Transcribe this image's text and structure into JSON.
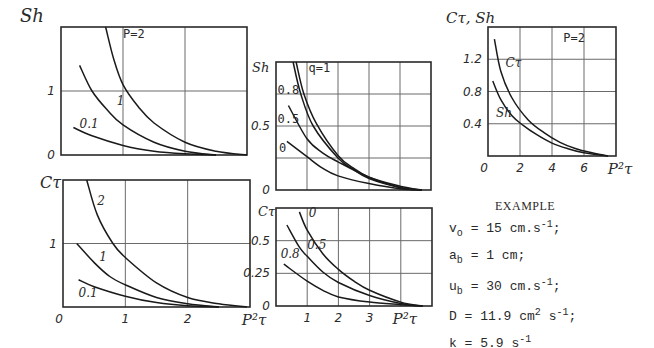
{
  "chart_data": [
    {
      "id": "top-left",
      "type": "line",
      "ylabel": "Sh",
      "xlabel": "P²τ",
      "xlim": [
        0,
        3
      ],
      "ylim": [
        0,
        2
      ],
      "xgrid": [
        1,
        2
      ],
      "ygrid": [
        1
      ],
      "yticks": [
        {
          "v": 0,
          "label": "0"
        },
        {
          "v": 1,
          "label": "1"
        }
      ],
      "xticks": [],
      "annotation": "P=2",
      "series": [
        {
          "name": "2",
          "label": "P=2",
          "x": [
            0.72,
            0.85,
            1.0,
            1.25,
            1.5,
            2.0,
            2.5,
            3.0
          ],
          "y": [
            2.0,
            1.5,
            1.1,
            0.75,
            0.5,
            0.2,
            0.06,
            0.0
          ]
        },
        {
          "name": "1",
          "label": "1",
          "x": [
            0.3,
            0.5,
            0.75,
            1.0,
            1.5,
            2.0,
            2.5
          ],
          "y": [
            1.4,
            1.0,
            0.7,
            0.47,
            0.2,
            0.06,
            0.0
          ]
        },
        {
          "name": "0.1",
          "label": "0.1",
          "x": [
            0.2,
            0.5,
            1.0,
            1.5,
            2.0,
            2.5
          ],
          "y": [
            0.43,
            0.3,
            0.15,
            0.06,
            0.02,
            0.0
          ]
        }
      ]
    },
    {
      "id": "bottom-left",
      "type": "line",
      "ylabel": "Cτ",
      "xlabel": "P²τ",
      "xlim": [
        0,
        3
      ],
      "ylim": [
        0,
        2
      ],
      "xgrid": [
        1,
        2
      ],
      "ygrid": [
        1
      ],
      "yticks": [
        {
          "v": 1,
          "label": "1"
        }
      ],
      "xticks": [
        {
          "v": 0,
          "label": "0"
        },
        {
          "v": 1,
          "label": "1"
        },
        {
          "v": 2,
          "label": "2"
        },
        {
          "v": 3,
          "label": "P²τ"
        }
      ],
      "series": [
        {
          "name": "2",
          "label": "2",
          "x": [
            0.38,
            0.55,
            0.8,
            1.0,
            1.5,
            2.0,
            2.5,
            2.95
          ],
          "y": [
            2.0,
            1.45,
            1.0,
            0.78,
            0.38,
            0.15,
            0.05,
            0.0
          ]
        },
        {
          "name": "1",
          "label": "1",
          "x": [
            0.22,
            0.5,
            0.75,
            1.0,
            1.5,
            2.0,
            2.5
          ],
          "y": [
            1.0,
            0.7,
            0.48,
            0.35,
            0.15,
            0.05,
            0.0
          ]
        },
        {
          "name": "0.1",
          "label": "0.1",
          "x": [
            0.25,
            0.5,
            1.0,
            1.5,
            2.0,
            2.5
          ],
          "y": [
            0.43,
            0.32,
            0.17,
            0.07,
            0.02,
            0.0
          ]
        }
      ]
    },
    {
      "id": "middle-top",
      "type": "line",
      "ylabel": "Sh",
      "xlabel": "",
      "xlim": [
        0,
        5
      ],
      "ylim": [
        0,
        1
      ],
      "xgrid": [
        1,
        2,
        3,
        4
      ],
      "ygrid": [
        0.25,
        0.5,
        0.75
      ],
      "yticks": [
        {
          "v": 0,
          "label": "0"
        },
        {
          "v": 0.5,
          "label": "0.5"
        }
      ],
      "xticks": [],
      "annotation": "q=1",
      "series": [
        {
          "name": "1",
          "label": "q=1",
          "x": [
            0.65,
            0.9,
            1.3,
            2.0,
            2.5,
            3.0,
            4.0,
            4.7
          ],
          "y": [
            1.0,
            0.75,
            0.52,
            0.27,
            0.17,
            0.1,
            0.02,
            0.0
          ]
        },
        {
          "name": "0.8",
          "label": "0.8",
          "x": [
            0.55,
            0.8,
            1.2,
            2.0,
            2.5,
            3.0,
            4.0,
            4.7
          ],
          "y": [
            1.0,
            0.75,
            0.5,
            0.25,
            0.16,
            0.09,
            0.02,
            0.0
          ]
        },
        {
          "name": "0.5",
          "label": "0.5",
          "x": [
            0.4,
            1.0,
            1.5,
            2.0,
            3.0,
            4.0,
            4.7
          ],
          "y": [
            0.66,
            0.4,
            0.29,
            0.22,
            0.1,
            0.03,
            0.0
          ]
        },
        {
          "name": "0",
          "label": "0",
          "x": [
            0.35,
            1.0,
            1.5,
            2.0,
            3.0,
            4.0,
            4.7
          ],
          "y": [
            0.38,
            0.26,
            0.17,
            0.11,
            0.05,
            0.01,
            0.0
          ]
        }
      ]
    },
    {
      "id": "middle-bottom",
      "type": "line",
      "ylabel": "Cτ",
      "xlabel": "P²τ",
      "xlim": [
        0,
        5
      ],
      "ylim": [
        0,
        0.75
      ],
      "xgrid": [
        1,
        2,
        3,
        4
      ],
      "ygrid": [
        0.25,
        0.5
      ],
      "yticks": [
        {
          "v": 0,
          "label": "0"
        },
        {
          "v": 0.25,
          "label": "0.25"
        },
        {
          "v": 0.5,
          "label": "0.5"
        }
      ],
      "xticks": [
        {
          "v": 1,
          "label": "1"
        },
        {
          "v": 2,
          "label": "2"
        },
        {
          "v": 3,
          "label": "3"
        },
        {
          "v": 4,
          "label": "P²τ"
        }
      ],
      "series": [
        {
          "name": "0",
          "label": "0",
          "x": [
            0.75,
            1.0,
            1.5,
            2.0,
            2.5,
            3.0,
            4.0,
            4.7
          ],
          "y": [
            0.72,
            0.58,
            0.4,
            0.28,
            0.19,
            0.12,
            0.03,
            0.0
          ]
        },
        {
          "name": "0.5",
          "label": "0.5",
          "x": [
            0.35,
            0.75,
            1.0,
            1.5,
            2.0,
            3.0,
            4.0,
            4.7
          ],
          "y": [
            0.62,
            0.45,
            0.38,
            0.26,
            0.18,
            0.08,
            0.02,
            0.0
          ]
        },
        {
          "name": "0.8",
          "label": "0.8",
          "x": [
            0.25,
            1.0,
            1.5,
            2.0,
            3.0,
            4.0,
            4.7
          ],
          "y": [
            0.32,
            0.19,
            0.12,
            0.07,
            0.03,
            0.01,
            0.0
          ]
        }
      ]
    },
    {
      "id": "right",
      "type": "line",
      "ylabel": "Cτ, Sh",
      "xlabel": "P²τ",
      "xlim": [
        0,
        8
      ],
      "ylim": [
        0,
        1.6
      ],
      "xgrid": [
        2,
        4,
        6
      ],
      "ygrid": [
        0.4,
        0.8,
        1.2
      ],
      "yticks": [
        {
          "v": 0.4,
          "label": "0.4"
        },
        {
          "v": 0.8,
          "label": "0.8"
        },
        {
          "v": 1.2,
          "label": "1.2"
        }
      ],
      "xticks": [
        {
          "v": 0,
          "label": "0"
        },
        {
          "v": 2,
          "label": "2"
        },
        {
          "v": 4,
          "label": "4"
        },
        {
          "v": 6,
          "label": "6"
        },
        {
          "v": 8,
          "label": "P²τ"
        }
      ],
      "annotation": "P=2",
      "series": [
        {
          "name": "Cτ",
          "label": "Cτ",
          "x": [
            0.4,
            0.8,
            1.5,
            2.5,
            3.5,
            4.5,
            5.5,
            6.5,
            7.5
          ],
          "y": [
            1.45,
            1.05,
            0.72,
            0.45,
            0.29,
            0.17,
            0.09,
            0.04,
            0.0
          ]
        },
        {
          "name": "Sh",
          "label": "Sh",
          "x": [
            0.3,
            0.8,
            1.5,
            2.2,
            3.0,
            4.0,
            5.0,
            6.0,
            7.5
          ],
          "y": [
            0.93,
            0.7,
            0.5,
            0.38,
            0.27,
            0.16,
            0.09,
            0.04,
            0.0
          ]
        }
      ]
    }
  ],
  "example": {
    "title": "EXAMPLE",
    "lines": [
      {
        "sym": "v",
        "sub": "o",
        "eq": " = 15 cm.s",
        "sup": "-1",
        "tail": ";"
      },
      {
        "sym": "a",
        "sub": "b",
        "eq": " = 1 cm;",
        "sup": "",
        "tail": ""
      },
      {
        "sym": "u",
        "sub": "b",
        "eq": " = 30 cm.s",
        "sup": "-1",
        "tail": ";"
      },
      {
        "sym": "D",
        "sub": "",
        "eq": " =  11.9 cm",
        "sup": "2",
        "tail": " s",
        "sup2": "-1",
        "tail2": ";"
      },
      {
        "sym": "k",
        "sub": "",
        "eq": " =  5.9 s",
        "sup": "-1",
        "tail": ""
      }
    ]
  }
}
